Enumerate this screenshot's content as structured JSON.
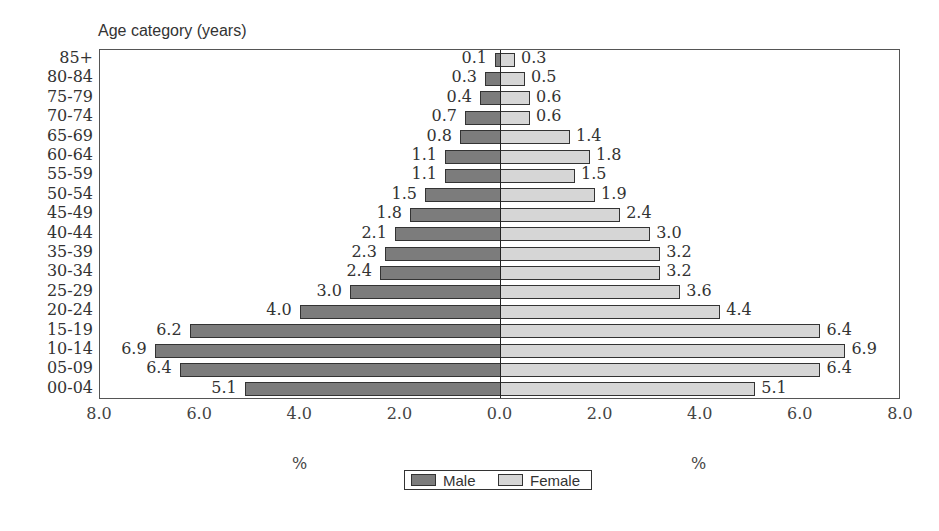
{
  "page": {
    "cut_title": "Figure: age and sex distribution of the study population (partially cropped title)"
  },
  "chart_data": {
    "type": "bar",
    "orientation": "horizontal-population-pyramid",
    "title": "",
    "ylabel": "Age category (years)",
    "xlabel_left": "%",
    "xlabel_right": "%",
    "xlim": [
      -8.0,
      8.0
    ],
    "xticks": [
      "8.0",
      "6.0",
      "4.0",
      "2.0",
      "0.0",
      "2.0",
      "4.0",
      "6.0",
      "8.0"
    ],
    "grid": false,
    "legend_position": "bottom-center",
    "categories": [
      "85+",
      "80-84",
      "75-79",
      "70-74",
      "65-69",
      "60-64",
      "55-59",
      "50-54",
      "45-49",
      "40-44",
      "35-39",
      "30-34",
      "25-29",
      "20-24",
      "15-19",
      "10-14",
      "05-09",
      "00-04"
    ],
    "series": [
      {
        "name": "Male",
        "side": "left",
        "color": "#7c7c7c",
        "values": [
          0.1,
          0.3,
          0.4,
          0.7,
          0.8,
          1.1,
          1.1,
          1.5,
          1.8,
          2.1,
          2.3,
          2.4,
          3.0,
          4.0,
          6.2,
          6.9,
          6.4,
          5.1
        ]
      },
      {
        "name": "Female",
        "side": "right",
        "color": "#d6d6d6",
        "values": [
          0.3,
          0.5,
          0.6,
          0.6,
          1.4,
          1.8,
          1.5,
          1.9,
          2.4,
          3.0,
          3.2,
          3.2,
          3.6,
          4.4,
          6.4,
          6.9,
          6.4,
          5.1
        ]
      }
    ]
  },
  "legend": {
    "male_label": "Male",
    "female_label": "Female"
  },
  "axis": {
    "ytitle": "Age category (years)",
    "pct_left": "%",
    "pct_right": "%"
  }
}
